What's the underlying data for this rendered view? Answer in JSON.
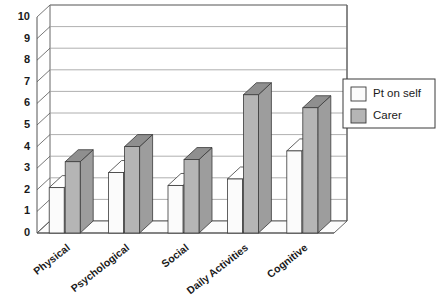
{
  "chart_data": {
    "type": "bar",
    "title": "",
    "subtitle": "",
    "xlabel": "",
    "ylabel": "",
    "ylim": [
      0,
      10
    ],
    "ytick_labels": [
      "0",
      "1",
      "2",
      "3",
      "4",
      "5",
      "6",
      "7",
      "8",
      "9",
      "10"
    ],
    "ytick_values": [
      0,
      1,
      2,
      3,
      4,
      5,
      6,
      7,
      8,
      9,
      10
    ],
    "grid": true,
    "grid_axis": "y",
    "legend_position": "right",
    "three_d": true,
    "categories": [
      "Physical",
      "Psychological",
      "Social",
      "Daily Activities",
      "Cognitive"
    ],
    "series": [
      {
        "name": "Pt on self",
        "color": "#fbfbfb",
        "values": [
          2.1,
          2.8,
          2.2,
          2.5,
          3.8
        ]
      },
      {
        "name": "Carer",
        "color": "#b5b5b5",
        "values": [
          3.3,
          4.0,
          3.4,
          6.4,
          5.8
        ]
      }
    ]
  },
  "legend": {
    "items": [
      {
        "label": "Pt on self",
        "swatch": "#fbfbfb"
      },
      {
        "label": "Carer",
        "swatch": "#b5b5b5"
      }
    ]
  },
  "colors": {
    "axis": "#555555",
    "grid": "#9a9a9a",
    "bar_light_face": "#fbfbfb",
    "bar_light_top": "#ffffff",
    "bar_light_side": "#e2e2e2",
    "bar_dark_face": "#b5b5b5",
    "bar_dark_top": "#8f8f8f",
    "bar_dark_side": "#9d9d9d",
    "outline": "#3a3a3a",
    "text": "#1a1a1a",
    "background": "#ffffff",
    "floor": "#fcfcfc"
  }
}
